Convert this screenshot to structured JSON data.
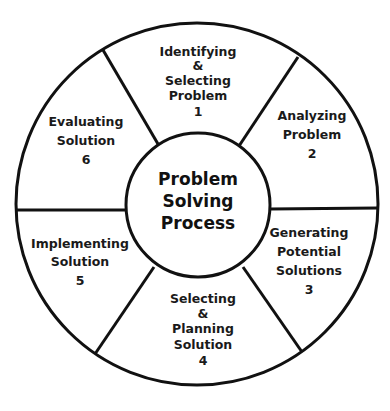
{
  "diagram": {
    "type": "cycle-wheel",
    "center": {
      "lines": [
        "Problem",
        "Solving",
        "Process"
      ]
    },
    "segments": [
      {
        "step": "1",
        "lines": [
          "Identifying",
          "&",
          "Selecting",
          "Problem",
          "1"
        ]
      },
      {
        "step": "2",
        "lines": [
          "Analyzing",
          "Problem",
          "2"
        ]
      },
      {
        "step": "3",
        "lines": [
          "Generating",
          "Potential",
          "Solutions",
          "3"
        ]
      },
      {
        "step": "4",
        "lines": [
          "Selecting",
          "&",
          "Planning",
          "Solution",
          "4"
        ]
      },
      {
        "step": "5",
        "lines": [
          "Implementing",
          "Solution",
          "5"
        ]
      },
      {
        "step": "6",
        "lines": [
          "Evaluating",
          "Solution",
          "6"
        ]
      }
    ],
    "colors": {
      "stroke": "#111111",
      "text": "#1a1a1a",
      "background": "#ffffff"
    }
  }
}
